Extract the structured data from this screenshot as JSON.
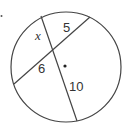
{
  "diagram": {
    "type": "circle-intersecting-chords",
    "stroke_color": "#444444",
    "circle": {
      "cx": 66,
      "cy": 67,
      "r": 55
    },
    "center_dot": {
      "cx": 65,
      "cy": 66
    },
    "corner_dot": {
      "cx": 1.5,
      "cy": 16
    },
    "chords": [
      {
        "name": "chord-x-10",
        "x1": 41,
        "y1": 16,
        "x2": 77,
        "y2": 121
      },
      {
        "name": "chord-5-6",
        "x1": 90,
        "y1": 17,
        "x2": 14,
        "y2": 84
      }
    ],
    "labels": {
      "x": "x",
      "five": "5",
      "six": "6",
      "ten": "10"
    }
  }
}
